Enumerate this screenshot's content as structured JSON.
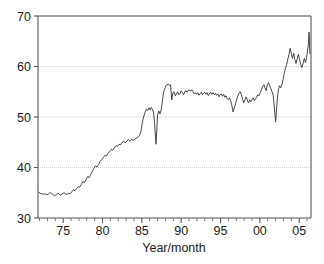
{
  "chart_data": {
    "type": "line",
    "title": "",
    "subtitle": "",
    "xlabel": "Year/month",
    "ylabel": "",
    "xlim": [
      1971.8,
      2006.5
    ],
    "ylim": [
      30,
      70
    ],
    "grid": true,
    "legend": false,
    "legend_position": "none",
    "x_tick_labels": [
      "75",
      "80",
      "85",
      "90",
      "95",
      "00",
      "05"
    ],
    "x_tick_values": [
      1975,
      1980,
      1985,
      1990,
      1995,
      2000,
      2005
    ],
    "x_minor_tick_step": 1,
    "y_tick_labels": [
      "30",
      "40",
      "50",
      "60",
      "70"
    ],
    "y_tick_values": [
      30,
      40,
      50,
      60,
      70
    ],
    "line_color": "#333333",
    "grid_color": "#bbbbbb",
    "axis_color": "#555555",
    "series": [
      {
        "name": "value",
        "x": [
          1971.9,
          1972.1,
          1972.3,
          1972.5,
          1972.7,
          1972.9,
          1973.1,
          1973.3,
          1973.5,
          1973.7,
          1973.9,
          1974.1,
          1974.3,
          1974.5,
          1974.7,
          1974.9,
          1975.1,
          1975.3,
          1975.5,
          1975.7,
          1975.9,
          1976.1,
          1976.3,
          1976.5,
          1976.7,
          1976.9,
          1977.1,
          1977.3,
          1977.5,
          1977.7,
          1977.9,
          1978.1,
          1978.3,
          1978.5,
          1978.7,
          1978.9,
          1979.1,
          1979.3,
          1979.5,
          1979.7,
          1979.9,
          1980.1,
          1980.3,
          1980.5,
          1980.7,
          1980.9,
          1981.1,
          1981.3,
          1981.5,
          1981.7,
          1981.9,
          1982.1,
          1982.3,
          1982.5,
          1982.7,
          1982.9,
          1983.1,
          1983.3,
          1983.5,
          1983.7,
          1983.9,
          1984.1,
          1984.3,
          1984.5,
          1984.7,
          1984.9,
          1985.0,
          1985.15,
          1985.3,
          1985.45,
          1985.6,
          1985.75,
          1985.9,
          1986.05,
          1986.2,
          1986.35,
          1986.5,
          1986.6,
          1986.7,
          1986.8,
          1986.9,
          1987.0,
          1987.15,
          1987.3,
          1987.45,
          1987.6,
          1987.75,
          1987.9,
          1988.05,
          1988.2,
          1988.35,
          1988.5,
          1988.65,
          1988.8,
          1988.95,
          1989.1,
          1989.25,
          1989.4,
          1989.55,
          1989.7,
          1989.85,
          1990.0,
          1990.15,
          1990.3,
          1990.45,
          1990.6,
          1990.75,
          1990.9,
          1991.05,
          1991.2,
          1991.35,
          1991.5,
          1991.65,
          1991.8,
          1991.95,
          1992.1,
          1992.25,
          1992.4,
          1992.55,
          1992.7,
          1992.85,
          1993.0,
          1993.15,
          1993.3,
          1993.45,
          1993.6,
          1993.75,
          1993.9,
          1994.05,
          1994.2,
          1994.35,
          1994.5,
          1994.65,
          1994.8,
          1994.95,
          1995.1,
          1995.25,
          1995.4,
          1995.55,
          1995.7,
          1995.85,
          1996.0,
          1996.15,
          1996.3,
          1996.45,
          1996.6,
          1996.75,
          1996.9,
          1997.05,
          1997.2,
          1997.35,
          1997.5,
          1997.65,
          1997.8,
          1997.95,
          1998.1,
          1998.25,
          1998.4,
          1998.55,
          1998.7,
          1998.85,
          1999.0,
          1999.15,
          1999.3,
          1999.45,
          1999.6,
          1999.75,
          1999.9,
          2000.05,
          2000.2,
          2000.35,
          2000.5,
          2000.65,
          2000.8,
          2000.95,
          2001.1,
          2001.25,
          2001.4,
          2001.55,
          2001.7,
          2001.8,
          2001.9,
          2002.0,
          2002.1,
          2002.2,
          2002.35,
          2002.5,
          2002.65,
          2002.8,
          2002.95,
          2003.1,
          2003.25,
          2003.4,
          2003.55,
          2003.7,
          2003.85,
          2004.0,
          2004.15,
          2004.3,
          2004.45,
          2004.6,
          2004.75,
          2004.9,
          2005.05,
          2005.2,
          2005.35,
          2005.5,
          2005.65,
          2005.8,
          2005.95,
          2006.05,
          2006.15,
          2006.25,
          2006.35
        ],
        "values": [
          35.1,
          34.9,
          34.8,
          34.7,
          34.8,
          34.6,
          34.7,
          35.0,
          34.9,
          34.6,
          34.4,
          34.6,
          34.9,
          34.7,
          34.5,
          34.8,
          35.0,
          34.8,
          34.7,
          34.9,
          34.8,
          35.2,
          35.6,
          35.4,
          35.8,
          36.2,
          36.1,
          36.6,
          37.2,
          37.0,
          37.6,
          38.2,
          38.0,
          38.6,
          39.2,
          39.8,
          40.3,
          40.1,
          40.6,
          41.2,
          41.6,
          42.0,
          42.4,
          42.3,
          42.8,
          43.2,
          43.6,
          43.4,
          43.9,
          44.3,
          44.2,
          44.6,
          44.5,
          45.0,
          45.2,
          44.9,
          45.3,
          45.5,
          45.2,
          45.6,
          45.4,
          45.6,
          45.8,
          46.0,
          46.3,
          47.2,
          48.4,
          49.6,
          50.4,
          51.1,
          51.6,
          51.3,
          51.8,
          51.4,
          51.9,
          51.5,
          50.8,
          49.0,
          46.8,
          44.6,
          47.5,
          50.4,
          51.2,
          50.6,
          51.4,
          53.0,
          54.8,
          55.6,
          56.2,
          56.4,
          56.5,
          56.3,
          56.4,
          53.4,
          54.8,
          55.0,
          54.2,
          54.6,
          55.0,
          54.4,
          54.6,
          55.2,
          54.8,
          54.4,
          55.0,
          55.2,
          54.9,
          55.3,
          55.4,
          55.1,
          55.4,
          55.0,
          54.6,
          54.8,
          54.5,
          54.8,
          54.3,
          54.6,
          54.9,
          54.4,
          54.7,
          54.9,
          54.5,
          54.8,
          54.2,
          54.6,
          54.9,
          54.5,
          54.8,
          54.4,
          54.7,
          54.3,
          54.6,
          54.0,
          54.4,
          54.6,
          54.1,
          54.5,
          53.9,
          54.2,
          53.6,
          53.4,
          53.8,
          53.2,
          52.2,
          51.0,
          51.8,
          52.6,
          53.4,
          54.2,
          54.8,
          55.0,
          54.4,
          53.6,
          52.8,
          53.4,
          54.0,
          53.4,
          52.8,
          53.4,
          53.0,
          53.4,
          53.8,
          53.2,
          53.6,
          54.0,
          54.4,
          54.2,
          54.8,
          55.4,
          56.0,
          56.4,
          55.8,
          55.2,
          56.4,
          56.8,
          56.2,
          55.6,
          55.0,
          54.2,
          52.6,
          50.8,
          49.0,
          51.0,
          53.2,
          55.4,
          56.2,
          55.8,
          56.4,
          57.4,
          58.6,
          59.6,
          60.4,
          61.4,
          62.4,
          63.6,
          62.6,
          61.6,
          62.6,
          61.4,
          60.6,
          61.6,
          62.4,
          61.4,
          60.4,
          59.8,
          60.6,
          61.6,
          60.8,
          61.8,
          63.0,
          64.2,
          66.8,
          62.6
        ]
      }
    ]
  },
  "axis": {
    "x_title": "Year/month"
  }
}
